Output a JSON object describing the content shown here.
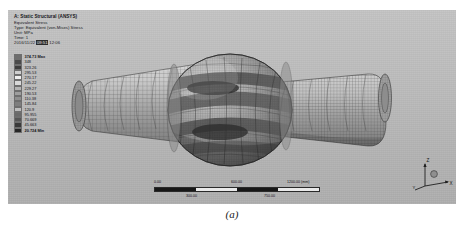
{
  "figure": {
    "caption": "(a)"
  },
  "viewport": {
    "background_color": "#b9b9b9",
    "header": {
      "line1": "A: Static Structural (ANSYS)",
      "line2": "Equivalent Stress",
      "line3": "Type: Equivalent (von-Mises) Stress",
      "line4": "Unit: MPa",
      "line5": "Time: 1",
      "line6_date": "2016/11/22",
      "line6_time": "09:51",
      "line6_suffix": "12:06"
    },
    "legend": {
      "max_label": "374.73 Max",
      "min_label": "20.724 Min",
      "entries": [
        {
          "value": "374.73 Max",
          "color": "#6e6e6e"
        },
        {
          "value": "348",
          "color": "#4a4a4a"
        },
        {
          "value": "323.26",
          "color": "#3d3d3d"
        },
        {
          "value": "295.53",
          "color": "#cfcfcf"
        },
        {
          "value": "270.17",
          "color": "#efefef"
        },
        {
          "value": "245.22",
          "color": "#d9d9d9"
        },
        {
          "value": "229.27",
          "color": "#b4b4b4"
        },
        {
          "value": "190.53",
          "color": "#9e9e9e"
        },
        {
          "value": "110.38",
          "color": "#8f8f8f"
        },
        {
          "value": "145.84",
          "color": "#7e7e7e"
        },
        {
          "value": "120.9",
          "color": "#bdbdbd"
        },
        {
          "value": "95.955",
          "color": "#6a6a6a"
        },
        {
          "value": "70.669",
          "color": "#565656"
        },
        {
          "value": "45.663",
          "color": "#3a3a3a"
        },
        {
          "value": "20.724 Min",
          "color": "#262626"
        }
      ]
    },
    "scale_bar": {
      "ticks_top": [
        "0.00",
        "600.00",
        "1200.00 (mm)"
      ],
      "ticks_bottom": [
        "300.00",
        "750.00"
      ]
    },
    "triad": {
      "z_label": "Z",
      "x_label": "X",
      "y_label": "Y"
    }
  }
}
